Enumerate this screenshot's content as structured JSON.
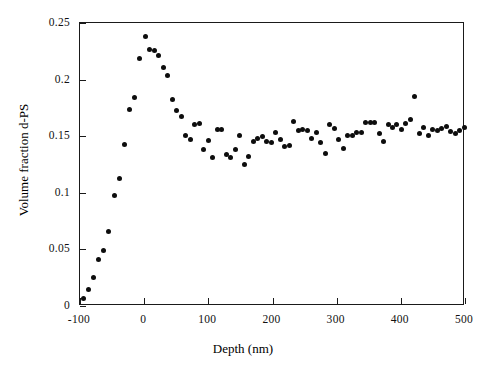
{
  "chart_data": {
    "type": "scatter",
    "title": "",
    "xlabel": "Depth (nm)",
    "ylabel": "Volume fraction d-PS",
    "xlim": [
      -100,
      500
    ],
    "ylim": [
      0,
      0.25
    ],
    "xticks": [
      -100,
      0,
      100,
      200,
      300,
      400,
      500
    ],
    "xtick_labels": [
      "-100",
      "0",
      "100",
      "200",
      "300",
      "400",
      "500"
    ],
    "yticks": [
      0,
      0.05,
      0.1,
      0.15,
      0.2,
      0.25
    ],
    "ytick_labels": [
      "0",
      "0.05",
      "0.1",
      "0.15",
      "0.2",
      "0.25"
    ],
    "grid": false,
    "legend": null,
    "marker": "filled-circle",
    "marker_color": "#0d0d0d",
    "marker_size_px": 5,
    "frame_color": "#1a1a1a",
    "background": "#ffffff",
    "series": [
      {
        "name": "Volume fraction d-PS",
        "x": [
          -95,
          -87,
          -79,
          -71,
          -63,
          -55,
          -47,
          -39,
          -31,
          -23,
          -15,
          -7,
          2,
          9,
          16,
          23,
          30,
          37,
          44,
          51,
          58,
          65,
          72,
          79,
          86,
          93,
          100,
          107,
          114,
          121,
          128,
          135,
          142,
          149,
          156,
          163,
          170,
          177,
          184,
          191,
          198,
          205,
          212,
          219,
          226,
          233,
          240,
          247,
          254,
          261,
          268,
          275,
          282,
          289,
          296,
          303,
          310,
          317,
          324,
          331,
          338,
          345,
          352,
          359,
          366,
          373,
          380,
          387,
          394,
          401,
          408,
          415,
          422,
          429,
          436,
          443,
          450,
          457,
          464,
          471,
          478,
          485,
          492,
          499
        ],
        "y": [
          0.007,
          0.015,
          0.025,
          0.041,
          0.049,
          0.066,
          0.098,
          0.113,
          0.143,
          0.174,
          0.184,
          0.219,
          0.238,
          0.227,
          0.226,
          0.221,
          0.211,
          0.204,
          0.182,
          0.173,
          0.167,
          0.151,
          0.147,
          0.16,
          0.161,
          0.138,
          0.146,
          0.131,
          0.156,
          0.156,
          0.134,
          0.131,
          0.138,
          0.151,
          0.125,
          0.132,
          0.145,
          0.148,
          0.15,
          0.145,
          0.144,
          0.153,
          0.147,
          0.141,
          0.142,
          0.163,
          0.155,
          0.156,
          0.155,
          0.148,
          0.153,
          0.144,
          0.135,
          0.16,
          0.157,
          0.147,
          0.139,
          0.151,
          0.151,
          0.153,
          0.153,
          0.162,
          0.162,
          0.162,
          0.152,
          0.145,
          0.16,
          0.158,
          0.16,
          0.156,
          0.161,
          0.165,
          0.185,
          0.152,
          0.158,
          0.151,
          0.156,
          0.155,
          0.157,
          0.159,
          0.154,
          0.152,
          0.155,
          0.158
        ]
      }
    ]
  },
  "axes": {
    "x_title": "Depth (nm)",
    "y_title": "Volume fraction d-PS"
  }
}
